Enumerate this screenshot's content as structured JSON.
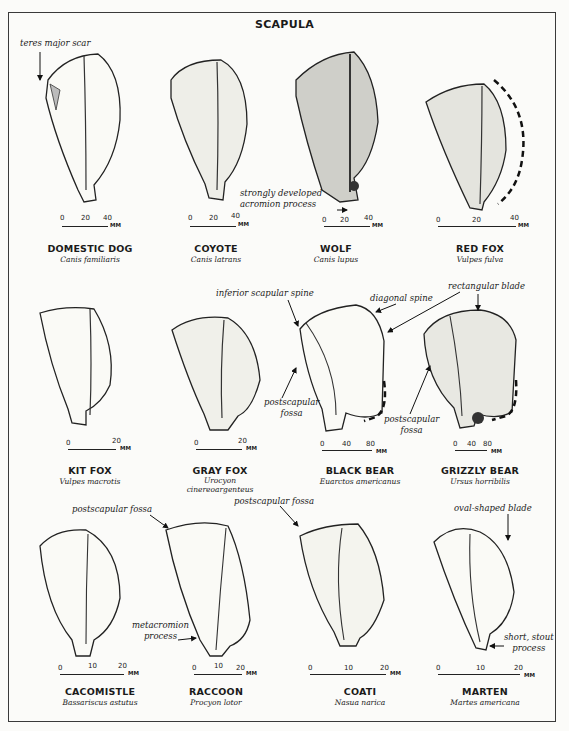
{
  "title": "SCAPULA",
  "specimens": [
    {
      "name": "DOMESTIC DOG",
      "scientific": "Canis familiaris",
      "scale": [
        "0",
        "20",
        "40"
      ],
      "unit": "MM"
    },
    {
      "name": "COYOTE",
      "scientific": "Canis latrans",
      "scale": [
        "0",
        "20",
        "40"
      ],
      "unit": "MM"
    },
    {
      "name": "WOLF",
      "scientific": "Canis lupus",
      "scale": [
        "0",
        "20",
        "40"
      ],
      "unit": "MM"
    },
    {
      "name": "RED FOX",
      "scientific": "Vulpes fulva",
      "scale": [
        "0",
        "20",
        "40"
      ],
      "unit": "MM"
    },
    {
      "name": "KIT FOX",
      "scientific": "Vulpes macrotis",
      "scale": [
        "0",
        "20"
      ],
      "unit": "MM"
    },
    {
      "name": "GRAY FOX",
      "scientific": "Urocyon",
      "scientific2": "cinereoargenteus",
      "scale": [
        "0",
        "20"
      ],
      "unit": "MM"
    },
    {
      "name": "BLACK BEAR",
      "scientific": "Euarctos americanus",
      "scale": [
        "0",
        "40",
        "80"
      ],
      "unit": "MM"
    },
    {
      "name": "GRIZZLY BEAR",
      "scientific": "Ursus horribilis",
      "scale": [
        "0",
        "40",
        "80"
      ],
      "unit": "MM"
    },
    {
      "name": "CACOMISTLE",
      "scientific": "Bassariscus astutus",
      "scale": [
        "0",
        "10",
        "20"
      ],
      "unit": "MM"
    },
    {
      "name": "RACCOON",
      "scientific": "Procyon lotor",
      "scale": [
        "0",
        "10",
        "20"
      ],
      "unit": "MM"
    },
    {
      "name": "COATI",
      "scientific": "Nasua narica",
      "scale": [
        "0",
        "10",
        "20"
      ],
      "unit": "MM"
    },
    {
      "name": "MARTEN",
      "scientific": "Martes americana",
      "scale": [
        "0",
        "10",
        "20"
      ],
      "unit": "MM"
    }
  ],
  "annotations": {
    "teres_major_scar": "teres major scar",
    "strongly_developed_1": "strongly developed",
    "strongly_developed_2": "acromion process",
    "inferior_scapular_spine": "inferior scapular spine",
    "diagonal_spine": "diagonal spine",
    "rectangular_blade": "rectangular blade",
    "postscapular_fossa_bb_1": "postscapular",
    "postscapular_fossa_bb_2": "fossa",
    "postscapular_fossa_gb_1": "postscapular",
    "postscapular_fossa_gb_2": "fossa",
    "postscapular_fossa_cac": "postscapular fossa",
    "postscapular_fossa_coati": "postscapular fossa",
    "metacromion_1": "metacromion",
    "metacromion_2": "process",
    "oval_shaped_blade": "oval-shaped blade",
    "short_stout_1": "short, stout",
    "short_stout_2": "process"
  }
}
